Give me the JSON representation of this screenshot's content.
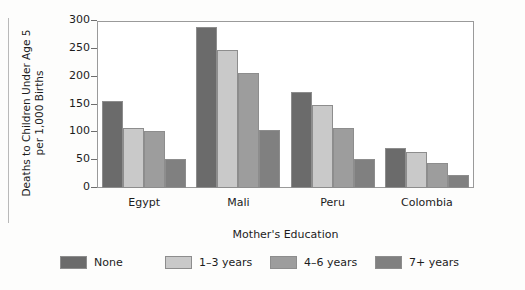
{
  "chart_data": {
    "type": "bar",
    "title": "",
    "xlabel": "Mother's Education",
    "ylabel": "Deaths to Children Under Age 5\nper 1,000 Births",
    "categories": [
      "Egypt",
      "Mali",
      "Peru",
      "Colombia"
    ],
    "ylim": [
      0,
      300
    ],
    "yticks": [
      0,
      50,
      100,
      150,
      200,
      250,
      300
    ],
    "ytick_labels": [
      "0",
      "50",
      "100",
      "150",
      "200",
      "250",
      "300"
    ],
    "grid": false,
    "legend_position": "bottom",
    "series": [
      {
        "name": "None",
        "color": "#6b6b6b",
        "values": [
          157,
          290,
          172,
          72
        ]
      },
      {
        "name": "1–3 years",
        "color": "#c9c9c9",
        "values": [
          108,
          248,
          150,
          65
        ]
      },
      {
        "name": "4–6 years",
        "color": "#9d9d9d",
        "values": [
          103,
          207,
          108,
          45
        ]
      },
      {
        "name": "7+ years",
        "color": "#808080",
        "values": [
          52,
          105,
          52,
          23
        ]
      }
    ]
  },
  "legend": {
    "items": [
      {
        "label": "None",
        "color": "#6b6b6b"
      },
      {
        "label": "1–3 years",
        "color": "#c9c9c9"
      },
      {
        "label": "4–6 years",
        "color": "#9d9d9d"
      },
      {
        "label": "7+ years",
        "color": "#808080"
      }
    ]
  }
}
